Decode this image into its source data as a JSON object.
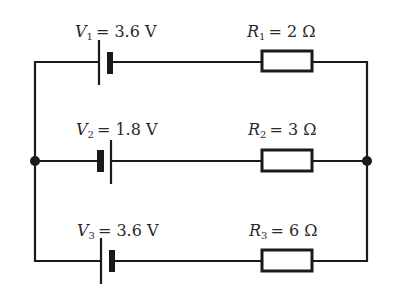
{
  "diagram": {
    "type": "circuit",
    "colors": {
      "wire": "#1a1a1a",
      "text": "#2a2a2a",
      "background": "#ffffff"
    },
    "branches": [
      {
        "battery": {
          "symbol": "V",
          "sub": "1",
          "value": "= 3.6 V",
          "orientation": "long-plate-left"
        },
        "resistor": {
          "symbol": "R",
          "sub": "1",
          "value": "= 2 Ω"
        }
      },
      {
        "battery": {
          "symbol": "V",
          "sub": "2",
          "value": "= 1.8 V",
          "orientation": "short-plate-left"
        },
        "resistor": {
          "symbol": "R",
          "sub": "2",
          "value": "= 3 Ω"
        }
      },
      {
        "battery": {
          "symbol": "V",
          "sub": "3",
          "value": "= 3.6 V",
          "orientation": "long-plate-left"
        },
        "resistor": {
          "symbol": "R",
          "sub": "3",
          "value": "= 6 Ω"
        }
      }
    ],
    "junctions": [
      "left-middle",
      "right-middle"
    ]
  }
}
